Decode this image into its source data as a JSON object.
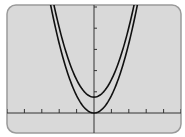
{
  "chart_data": {
    "type": "line",
    "title": "",
    "xlabel": "",
    "ylabel": "",
    "xlim": [
      -5.4,
      5.0
    ],
    "ylim": [
      -1.0,
      5.2
    ],
    "x_tick_step": 1,
    "y_tick_step": 1,
    "grid": false,
    "legend": null,
    "series": [
      {
        "name": "y = x^2",
        "expression": "x^2",
        "vertex": [
          0,
          0
        ]
      },
      {
        "name": "y = x^2 + c",
        "expression": "x^2 + 0.75",
        "vertex": [
          0,
          0.75
        ]
      }
    ]
  },
  "screen": {
    "background": "#d9d9d9",
    "frame_color": "#9a9a9a",
    "curve_color": "#111111",
    "axis_color": "#333333"
  }
}
